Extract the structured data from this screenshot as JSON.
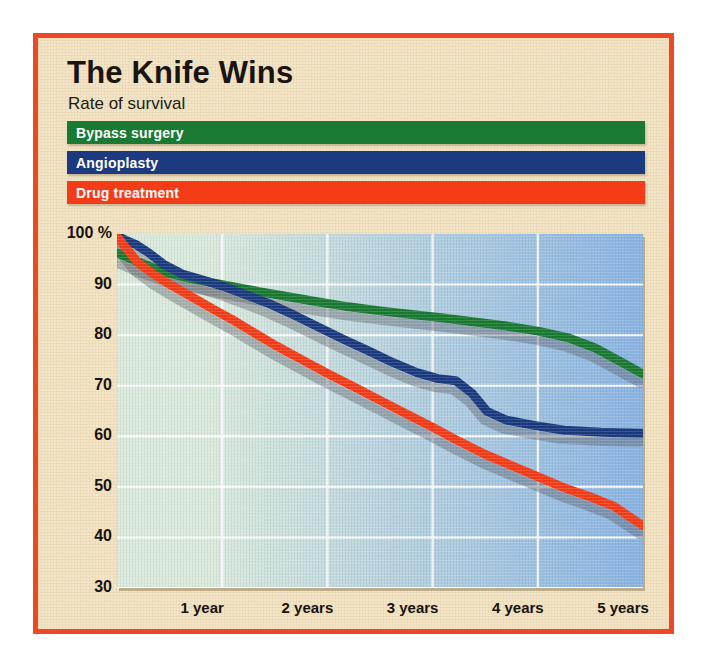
{
  "poster": {
    "title": "The Knife Wins",
    "subtitle": "Rate of survival",
    "border_color": "#f04824",
    "background_color": "#f2e4c4"
  },
  "legend": {
    "items": [
      {
        "label": "Bypass surgery",
        "color": "#1a7a33"
      },
      {
        "label": "Angioplasty",
        "color": "#1b3a7f"
      },
      {
        "label": "Drug treatment",
        "color": "#f43c18"
      }
    ]
  },
  "chart_data": {
    "type": "line",
    "title": "The Knife Wins",
    "subtitle": "Rate of survival",
    "xlabel": "",
    "ylabel": "",
    "ylim": [
      30,
      100
    ],
    "xlim": [
      0,
      5
    ],
    "grid": true,
    "legend_position": "top",
    "y_ticks": [
      {
        "value": 100,
        "label": "100 %"
      },
      {
        "value": 90,
        "label": "90"
      },
      {
        "value": 80,
        "label": "80"
      },
      {
        "value": 70,
        "label": "70"
      },
      {
        "value": 60,
        "label": "60"
      },
      {
        "value": 50,
        "label": "50"
      },
      {
        "value": 40,
        "label": "40"
      },
      {
        "value": 30,
        "label": "30"
      }
    ],
    "x_ticks": [
      {
        "value": 1,
        "label": "1 year"
      },
      {
        "value": 2,
        "label": "2 years"
      },
      {
        "value": 3,
        "label": "3 years"
      },
      {
        "value": 4,
        "label": "4 years"
      },
      {
        "value": 5,
        "label": "5 years"
      }
    ],
    "plot_background": {
      "gradient_from": "#d9e9dc",
      "gradient_to": "#89b3e2",
      "gridline_color": "#ffffff"
    },
    "series": [
      {
        "name": "Bypass surgery",
        "color": "#1a7a33",
        "x": [
          0.0,
          0.1,
          0.22,
          0.35,
          0.5,
          0.7,
          0.9,
          1.1,
          1.35,
          1.6,
          1.9,
          2.2,
          2.5,
          2.8,
          3.1,
          3.4,
          3.7,
          4.0,
          4.3,
          4.55,
          4.8,
          5.0
        ],
        "y": [
          96.2,
          95.4,
          94.3,
          93.3,
          92.2,
          91.2,
          90.4,
          89.6,
          88.6,
          87.7,
          86.6,
          85.6,
          84.8,
          84.1,
          83.4,
          82.6,
          81.8,
          80.8,
          79.4,
          77.4,
          74.6,
          72.3
        ]
      },
      {
        "name": "Angioplasty",
        "color": "#1b3a7f",
        "x": [
          0.0,
          0.08,
          0.18,
          0.3,
          0.45,
          0.62,
          0.8,
          1.0,
          1.2,
          1.45,
          1.7,
          1.95,
          2.15,
          2.4,
          2.62,
          2.85,
          3.05,
          3.22,
          3.38,
          3.52,
          3.7,
          3.95,
          4.25,
          4.6,
          5.0
        ],
        "y": [
          99.6,
          98.8,
          97.9,
          96.3,
          93.9,
          92.1,
          91.0,
          89.7,
          88.2,
          86.2,
          83.8,
          81.2,
          79.2,
          76.8,
          74.6,
          72.6,
          71.4,
          71.0,
          68.4,
          64.9,
          63.2,
          62.2,
          61.2,
          60.8,
          60.6
        ]
      },
      {
        "name": "Drug treatment",
        "color": "#f43c18",
        "x": [
          0.0,
          0.08,
          0.2,
          0.35,
          0.52,
          0.7,
          0.9,
          1.1,
          1.3,
          1.52,
          1.75,
          2.0,
          2.25,
          2.5,
          2.75,
          3.0,
          3.25,
          3.5,
          3.75,
          4.0,
          4.25,
          4.5,
          4.72,
          5.0
        ],
        "y": [
          99.5,
          97.4,
          94.3,
          92.0,
          89.8,
          87.7,
          85.3,
          83.0,
          80.5,
          77.8,
          75.2,
          72.4,
          69.8,
          67.1,
          64.4,
          61.8,
          59.0,
          56.4,
          54.2,
          52.0,
          49.8,
          48.0,
          46.2,
          42.3
        ]
      }
    ]
  }
}
